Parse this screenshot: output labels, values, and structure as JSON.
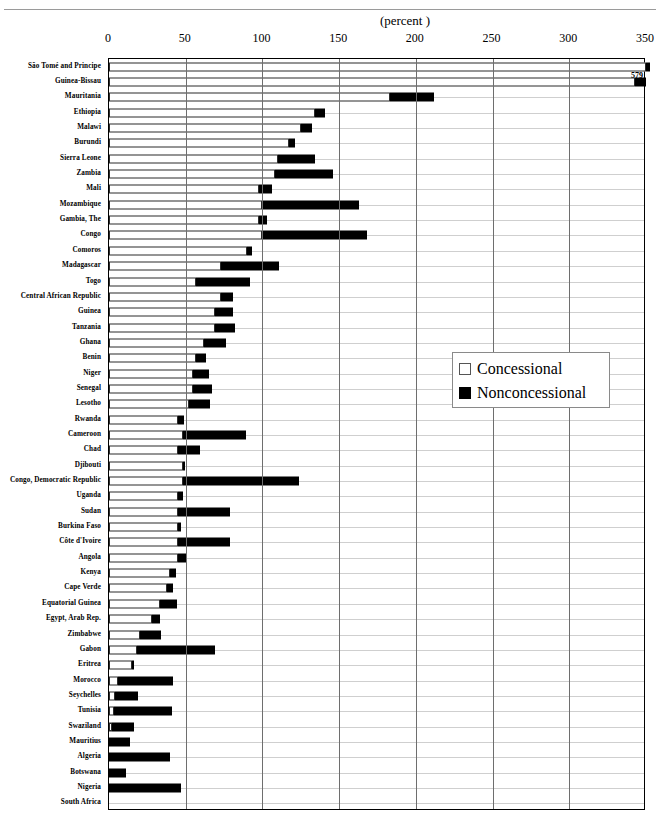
{
  "figure": {
    "clipped_caption": "",
    "unit_label": "(percent )"
  },
  "legend": {
    "items": [
      {
        "key": "concessional",
        "label": "Concessional",
        "color": "#ffffff"
      },
      {
        "key": "nonconcessional",
        "label": "Nonconcessional",
        "color": "#000000"
      }
    ]
  },
  "chart_data": {
    "type": "bar",
    "orientation": "horizontal",
    "stacked": true,
    "title": "",
    "xlabel": "(percent )",
    "ylabel": "",
    "xlim": [
      0,
      350
    ],
    "xticks": [
      0,
      50,
      100,
      150,
      200,
      250,
      300,
      350
    ],
    "xtick_labels": [
      "0",
      "50",
      "100",
      "150",
      "200",
      "250",
      "300",
      "350"
    ],
    "grid": "vertical",
    "legend_position": "middle-right",
    "series": [
      {
        "name": "Concessional",
        "color": "#ffffff"
      },
      {
        "name": "Nonconcessional",
        "color": "#000000"
      }
    ],
    "categories": [
      "São Tomé and Principe",
      "Guinea-Bissau",
      "Mauritania",
      "Ethiopia",
      "Malawi",
      "Burundi",
      "Sierra Leone",
      "Zambia",
      "Mali",
      "Mozambique",
      "Gambia, The",
      "Congo",
      "Comoros",
      "Madagascar",
      "Togo",
      "Central African Republic",
      "Guinea",
      "Tanzania",
      "Ghana",
      "Benin",
      "Niger",
      "Senegal",
      "Lesotho",
      "Rwanda",
      "Cameroon",
      "Chad",
      "Djibouti",
      "Congo, Democratic  Republic",
      "Uganda",
      "Sudan",
      "Burkina Faso",
      "Côte d'Ivoire",
      "Angola",
      "Kenya",
      "Cape Verde",
      "Equatorial Guinea",
      "Egypt,  Arab Rep.",
      "Zimbabwe",
      "Gabon",
      "Eritrea",
      "Morocco",
      "Seychelles",
      "Tunisia",
      "Swaziland",
      "Mauritius",
      "Algeria",
      "Botswana",
      "Nigeria",
      "South Africa"
    ],
    "concessional": [
      350,
      343,
      183,
      134,
      125,
      117,
      110,
      108,
      98,
      100,
      98,
      100,
      90,
      73,
      57,
      73,
      69,
      69,
      62,
      57,
      55,
      55,
      52,
      45,
      48,
      45,
      48,
      48,
      45,
      45,
      45,
      45,
      45,
      40,
      38,
      33,
      28,
      20,
      18,
      15,
      6,
      4,
      3,
      2,
      0,
      0,
      0,
      0,
      0
    ],
    "nonconcessional": [
      229,
      14,
      29,
      7,
      7,
      4,
      24,
      38,
      8,
      63,
      5,
      68,
      3,
      38,
      35,
      8,
      12,
      13,
      14,
      6,
      10,
      12,
      14,
      4,
      41,
      14,
      1,
      76,
      3,
      34,
      2,
      34,
      5,
      4,
      4,
      11,
      5,
      14,
      51,
      1,
      36,
      15,
      38,
      14,
      14,
      40,
      11,
      47,
      0
    ],
    "annotations": [
      {
        "category": "São Tomé and Principe",
        "text": "579",
        "value": 579
      }
    ]
  }
}
